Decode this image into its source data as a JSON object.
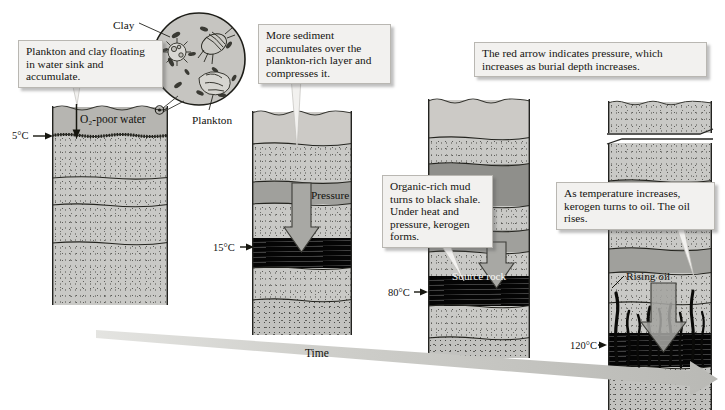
{
  "diagram": {
    "time_axis_label": "Time",
    "colors": {
      "shale_black": "#050505",
      "sediment_light": "#cccac6",
      "sediment_speckle": "#c9c9c6",
      "gray_band": "#a0a09c",
      "callout_bg": "#f2f1ef",
      "arrow_gray": "#b0b0ac",
      "time_arrow": "#c6c6c2"
    }
  },
  "stages": [
    {
      "id": "stage-1",
      "callout": "Plankton and clay floating in water sink and accumulate.",
      "water_label": "O₂-poor water",
      "temperature": "5°C",
      "inset": {
        "clay_label": "Clay",
        "plankton_label": "Plankton"
      }
    },
    {
      "id": "stage-2",
      "callout": "More sediment accumulates over the plankton-rich layer and compresses it.",
      "arrow_label": "Pressure",
      "temperature": "15°C"
    },
    {
      "id": "stage-3",
      "callout": "Organic-rich mud turns to black shale. Under heat and pressure, kerogen forms.",
      "rock_label": "Source rock",
      "temperature": "80°C"
    },
    {
      "id": "stage-4",
      "callout": "As temperature increases, kerogen turns to oil. The oil rises.",
      "oil_label": "Rising oil",
      "temperature": "120°C"
    }
  ],
  "notes": {
    "pressure_note": "The red arrow indicates pressure, which increases as burial depth increases."
  }
}
